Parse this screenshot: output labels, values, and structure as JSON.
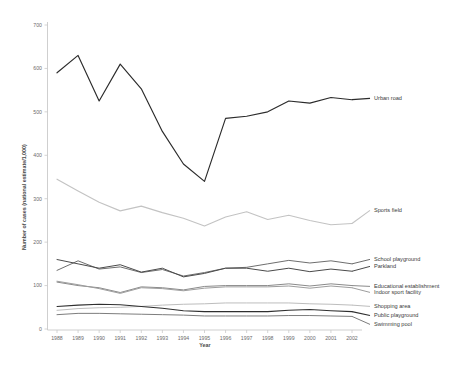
{
  "chart_data": {
    "type": "line",
    "title": "",
    "xlabel": "Year",
    "ylabel": "Number of cases (national estimate/1,000)",
    "x": [
      1988,
      1989,
      1990,
      1991,
      1992,
      1993,
      1994,
      1995,
      1996,
      1997,
      1998,
      1999,
      2000,
      2001,
      2002
    ],
    "xtick_labels": [
      "1988",
      "1989",
      "1990",
      "1991",
      "1992",
      "1993",
      "1994",
      "1995",
      "1996",
      "1997",
      "1998",
      "1999",
      "2000",
      "2001",
      "2002"
    ],
    "ytick_labels": [
      "0",
      "100",
      "200",
      "300",
      "400",
      "500",
      "600",
      "700"
    ],
    "ytick_values": [
      0,
      100,
      200,
      300,
      400,
      500,
      600,
      700
    ],
    "ylim": [
      0,
      700
    ],
    "xlim": [
      1988,
      2002
    ],
    "grid": false,
    "legend_position": "right-inline-labels",
    "series": [
      {
        "name": "Urban road",
        "color": "#2b2b2b",
        "width": 1.15,
        "label_x": 1988,
        "values": [
          590,
          630,
          525,
          610,
          553,
          455,
          380,
          340,
          485,
          490,
          500,
          525,
          520,
          533,
          528
        ]
      },
      {
        "name": "Sports field",
        "color": "#c3c3c3",
        "width": 1.1,
        "values": [
          345,
          318,
          292,
          272,
          283,
          268,
          255,
          237,
          258,
          270,
          252,
          262,
          250,
          240,
          243
        ]
      },
      {
        "name": "School playground",
        "color": "#6e6e6e",
        "width": 1.0,
        "values": [
          135,
          157,
          138,
          143,
          130,
          137,
          122,
          130,
          140,
          142,
          150,
          158,
          152,
          157,
          150
        ]
      },
      {
        "name": "Parkland",
        "color": "#4a4a4a",
        "width": 1.0,
        "values": [
          160,
          150,
          140,
          148,
          131,
          140,
          120,
          128,
          140,
          140,
          133,
          140,
          132,
          138,
          133
        ]
      },
      {
        "name": "Educational establishment",
        "color": "#8a8a8a",
        "width": 1.0,
        "values": [
          108,
          100,
          95,
          84,
          97,
          95,
          90,
          98,
          100,
          100,
          100,
          104,
          99,
          104,
          100
        ]
      },
      {
        "name": "Indoor sport facility",
        "color": "#9d9d9d",
        "width": 1.0,
        "values": [
          110,
          102,
          93,
          82,
          95,
          93,
          88,
          94,
          97,
          97,
          97,
          99,
          94,
          99,
          95
        ]
      },
      {
        "name": "Shopping area",
        "color": "#bdbdbd",
        "width": 1.0,
        "values": [
          43,
          47,
          49,
          50,
          52,
          55,
          57,
          58,
          60,
          60,
          60,
          60,
          58,
          57,
          55
        ]
      },
      {
        "name": "Public playground",
        "color": "#2f2f2f",
        "width": 1.05,
        "values": [
          52,
          55,
          57,
          56,
          52,
          48,
          42,
          40,
          40,
          40,
          40,
          43,
          45,
          42,
          40
        ]
      },
      {
        "name": "Swimming pool",
        "color": "#7d7d7d",
        "width": 1.0,
        "values": [
          33,
          36,
          36,
          35,
          34,
          33,
          32,
          30,
          30,
          30,
          30,
          31,
          31,
          30,
          29
        ]
      }
    ],
    "series_label_text": {
      "urban_road": "Urban road",
      "sports_field": "Sports field",
      "school_playground": "School playground",
      "parkland": "Parkland",
      "educational_establishment": "Educational establishment",
      "indoor_sport_facility": "Indoor sport facility",
      "shopping_area": "Shopping area",
      "public_playground": "Public playground",
      "swimming_pool": "Swimming pool"
    }
  }
}
